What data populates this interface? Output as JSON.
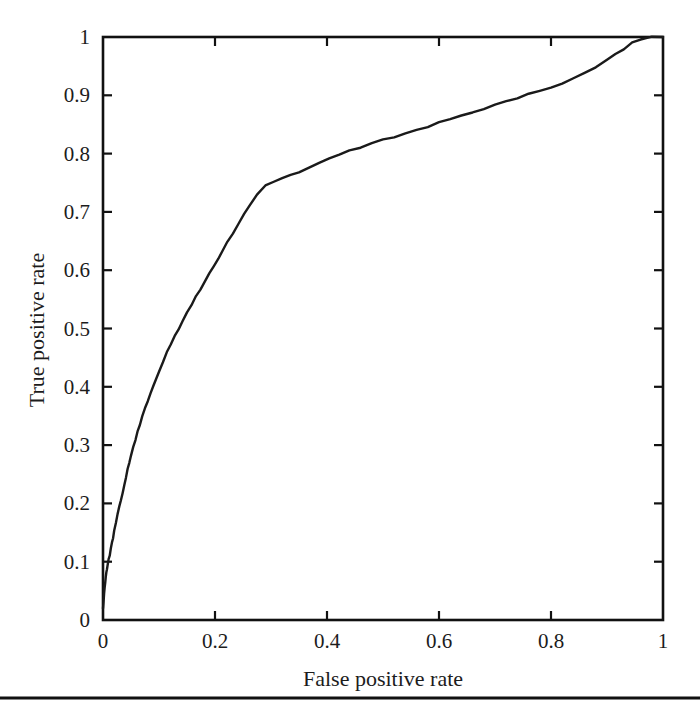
{
  "figure": {
    "background_color": "#ffffff",
    "line_color": "#1a1a1a",
    "axis_color": "#111111",
    "footer_rule": "horizontal-rule"
  },
  "chart_data": {
    "type": "line",
    "title": "",
    "xlabel": "False positive rate",
    "ylabel": "True positive rate",
    "xlim": [
      0,
      1
    ],
    "ylim": [
      0,
      1
    ],
    "grid": false,
    "legend": null,
    "xticks": [
      "0",
      "0.2",
      "0.4",
      "0.6",
      "0.8",
      "1"
    ],
    "xtick_values": [
      0,
      0.2,
      0.4,
      0.6,
      0.8,
      1
    ],
    "yticks": [
      "0",
      "0.1",
      "0.2",
      "0.3",
      "0.4",
      "0.5",
      "0.6",
      "0.7",
      "0.8",
      "0.9",
      "1"
    ],
    "ytick_values": [
      0,
      0.1,
      0.2,
      0.3,
      0.4,
      0.5,
      0.6,
      0.7,
      0.8,
      0.9,
      1.0
    ],
    "series": [
      {
        "name": "ROC curve",
        "x": [
          0.0,
          0.001,
          0.002,
          0.003,
          0.004,
          0.005,
          0.006,
          0.007,
          0.008,
          0.01,
          0.012,
          0.014,
          0.016,
          0.018,
          0.02,
          0.023,
          0.026,
          0.029,
          0.032,
          0.035,
          0.038,
          0.041,
          0.044,
          0.047,
          0.05,
          0.054,
          0.058,
          0.062,
          0.066,
          0.07,
          0.075,
          0.08,
          0.085,
          0.09,
          0.095,
          0.1,
          0.107,
          0.114,
          0.121,
          0.128,
          0.135,
          0.142,
          0.15,
          0.158,
          0.166,
          0.174,
          0.182,
          0.19,
          0.198,
          0.206,
          0.214,
          0.222,
          0.232,
          0.242,
          0.252,
          0.262,
          0.275,
          0.29,
          0.305,
          0.32,
          0.335,
          0.35,
          0.368,
          0.386,
          0.404,
          0.422,
          0.44,
          0.46,
          0.48,
          0.5,
          0.52,
          0.54,
          0.56,
          0.58,
          0.6,
          0.62,
          0.64,
          0.66,
          0.68,
          0.7,
          0.72,
          0.74,
          0.76,
          0.78,
          0.8,
          0.82,
          0.84,
          0.86,
          0.88,
          0.9,
          0.915,
          0.93,
          0.945,
          0.96,
          0.98,
          1.0
        ],
        "y": [
          0.02,
          0.032,
          0.045,
          0.056,
          0.066,
          0.075,
          0.082,
          0.088,
          0.094,
          0.103,
          0.112,
          0.122,
          0.132,
          0.142,
          0.152,
          0.166,
          0.18,
          0.193,
          0.206,
          0.219,
          0.232,
          0.245,
          0.258,
          0.27,
          0.282,
          0.296,
          0.31,
          0.323,
          0.336,
          0.348,
          0.362,
          0.376,
          0.39,
          0.403,
          0.415,
          0.427,
          0.443,
          0.458,
          0.472,
          0.486,
          0.499,
          0.512,
          0.527,
          0.541,
          0.555,
          0.568,
          0.581,
          0.594,
          0.607,
          0.62,
          0.634,
          0.648,
          0.664,
          0.68,
          0.696,
          0.712,
          0.73,
          0.745,
          0.752,
          0.757,
          0.762,
          0.768,
          0.776,
          0.784,
          0.791,
          0.798,
          0.804,
          0.811,
          0.817,
          0.823,
          0.829,
          0.835,
          0.841,
          0.847,
          0.853,
          0.859,
          0.865,
          0.871,
          0.877,
          0.883,
          0.889,
          0.895,
          0.901,
          0.907,
          0.914,
          0.921,
          0.929,
          0.938,
          0.948,
          0.96,
          0.97,
          0.98,
          0.99,
          0.996,
          0.999,
          1.0
        ]
      }
    ]
  }
}
